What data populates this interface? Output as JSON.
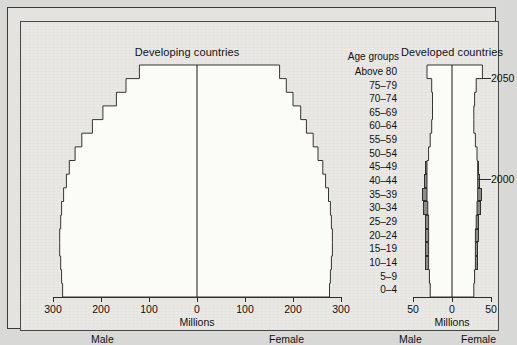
{
  "figure": {
    "background_color": "#e4e3e0",
    "bar_color": "#8b8b8b",
    "outline_color": "#35352f"
  },
  "age_groups": {
    "header": "Age groups",
    "labels": [
      "Above 80",
      "75–79",
      "70–74",
      "65–69",
      "60–64",
      "55–59",
      "50–54",
      "45–49",
      "40–44",
      "35–39",
      "30–34",
      "25–29",
      "20–24",
      "15–19",
      "10–14",
      "5–9",
      "0–4"
    ]
  },
  "panels": {
    "left": {
      "title": "Developing countries",
      "axis_caption": "Millions",
      "male_label": "Male",
      "female_label": "Female",
      "tick_labels": [
        "300",
        "200",
        "100",
        "0",
        "100",
        "200",
        "300"
      ],
      "tick_values": [
        -300,
        -200,
        -100,
        0,
        100,
        200,
        300
      ],
      "annotation_2000": "2000",
      "annotation_2050": "2050"
    },
    "right": {
      "title": "Developed countries",
      "axis_caption": "Millions",
      "male_label": "Male",
      "female_label": "Female",
      "tick_labels": [
        "50",
        "0",
        "50"
      ],
      "tick_values": [
        -50,
        0,
        50
      ],
      "annotation_2000": "2000",
      "annotation_2050": "2050"
    }
  },
  "chart_data": [
    {
      "type": "bar",
      "chart_name": "developing-countries-population-pyramid",
      "title": "Developing countries",
      "orientation": "horizontal-pyramid",
      "xlabel": "Millions",
      "ylabel": "Age groups",
      "xlim": [
        -300,
        300
      ],
      "xtick_labels": [
        "300",
        "200",
        "100",
        "0",
        "100",
        "200",
        "300"
      ],
      "grid": false,
      "legend": [
        "2000",
        "2050"
      ],
      "legend_position": "inline-annotation",
      "categories": [
        "Above 80",
        "75–79",
        "70–74",
        "65–69",
        "60–64",
        "55–59",
        "50–54",
        "45–49",
        "40–44",
        "35–39",
        "30–34",
        "25–29",
        "20–24",
        "15–19",
        "10–14",
        "5–9",
        "0–4"
      ],
      "series": [
        {
          "name": "2000",
          "style": "filled-gray-bars",
          "male": [
            12,
            22,
            34,
            48,
            62,
            80,
            98,
            120,
            142,
            164,
            190,
            216,
            240,
            258,
            268,
            272,
            276
          ],
          "female": [
            14,
            24,
            36,
            50,
            64,
            82,
            100,
            122,
            144,
            166,
            190,
            214,
            238,
            254,
            262,
            266,
            268
          ]
        },
        {
          "name": "2050",
          "style": "stepped-outline",
          "male": [
            120,
            148,
            168,
            196,
            218,
            240,
            254,
            266,
            272,
            278,
            282,
            284,
            286,
            286,
            284,
            282,
            280
          ],
          "female": [
            172,
            186,
            200,
            216,
            228,
            242,
            252,
            262,
            268,
            274,
            278,
            280,
            282,
            282,
            280,
            278,
            276
          ]
        }
      ]
    },
    {
      "type": "bar",
      "chart_name": "developed-countries-population-pyramid",
      "title": "Developed countries",
      "orientation": "horizontal-pyramid",
      "xlabel": "Millions",
      "ylabel": "Age groups",
      "xlim": [
        -50,
        50
      ],
      "xtick_labels": [
        "50",
        "0",
        "50"
      ],
      "grid": false,
      "legend": [
        "2000",
        "2050"
      ],
      "legend_position": "inline-annotation",
      "categories": [
        "Above 80",
        "75–79",
        "70–74",
        "65–69",
        "60–64",
        "55–59",
        "50–54",
        "45–49",
        "40–44",
        "35–39",
        "30–34",
        "25–29",
        "20–24",
        "15–19",
        "10–14",
        "5–9",
        "0–4"
      ],
      "series": [
        {
          "name": "2000",
          "style": "filled-gray-bars",
          "male": [
            9,
            11,
            15,
            18,
            20,
            24,
            30,
            34,
            36,
            38,
            37,
            35,
            34,
            34,
            34,
            30,
            28
          ],
          "female": [
            14,
            15,
            18,
            20,
            22,
            26,
            31,
            35,
            36,
            38,
            37,
            35,
            34,
            33,
            33,
            29,
            27
          ]
        },
        {
          "name": "2050",
          "style": "stepped-outline",
          "male": [
            32,
            26,
            25,
            25,
            26,
            28,
            30,
            32,
            32,
            32,
            31,
            30,
            30,
            30,
            30,
            29,
            28
          ],
          "female": [
            39,
            31,
            29,
            28,
            28,
            30,
            32,
            33,
            33,
            33,
            32,
            31,
            30,
            30,
            30,
            29,
            28
          ]
        }
      ]
    }
  ]
}
